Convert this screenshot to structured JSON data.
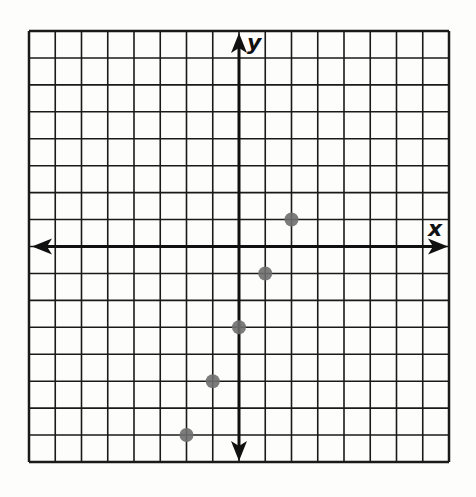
{
  "chart_data": {
    "type": "scatter",
    "title": "",
    "xlabel": "x",
    "ylabel": "y",
    "xlim": [
      -8,
      8
    ],
    "ylim": [
      -8,
      8
    ],
    "grid": true,
    "tick_labels": false,
    "points": [
      {
        "x": -2,
        "y": -7
      },
      {
        "x": -1,
        "y": -5
      },
      {
        "x": 0,
        "y": -3
      },
      {
        "x": 1,
        "y": -1
      },
      {
        "x": 2,
        "y": 1
      }
    ],
    "point_color": "#6e6e6e",
    "grid_color": "#1a1a1a"
  },
  "axes": {
    "x_label": "x",
    "y_label": "y"
  }
}
